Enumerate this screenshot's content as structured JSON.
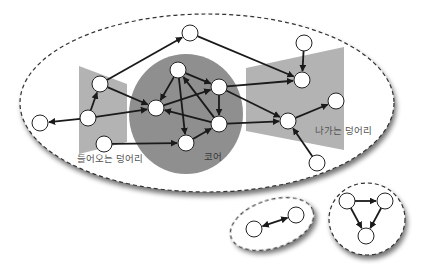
{
  "diagram": {
    "colors": {
      "background": "#ffffff",
      "core_fill": "#8f8f8f",
      "wing_fill": "#b3b3b3",
      "node_fill": "#ffffff",
      "node_stroke": "#222222",
      "edge": "#1a1a1a",
      "boundary": "#333333",
      "label_text": "#555555",
      "core_label_text": "#3a3a3a"
    },
    "labels": {
      "in_component": "들어오는 덩어리",
      "core": "코어",
      "out_component": "나가는 덩어리"
    },
    "regions": [
      {
        "id": "giant",
        "type": "dashed-ellipse",
        "cx": 207,
        "cy": 103,
        "rx": 187,
        "ry": 89
      },
      {
        "id": "in_wing",
        "type": "trapezoid",
        "points": "79,66 127,84 127,142 79,154"
      },
      {
        "id": "core",
        "type": "ellipse",
        "cx": 186,
        "cy": 114,
        "rx": 57,
        "ry": 60
      },
      {
        "id": "out_wing",
        "type": "trapezoid",
        "points": "246,68 344,47 344,150 246,131"
      },
      {
        "id": "small_pair",
        "type": "dashed-ellipse",
        "cx": 272,
        "cy": 224,
        "rx": 43,
        "ry": 24,
        "rotate": -18
      },
      {
        "id": "small_triangle",
        "type": "dashed-ellipse",
        "cx": 367,
        "cy": 219,
        "rx": 38,
        "ry": 36
      }
    ],
    "nodes": [
      {
        "id": "A",
        "x": 190,
        "y": 33
      },
      {
        "id": "B",
        "x": 100,
        "y": 84
      },
      {
        "id": "C",
        "x": 88,
        "y": 118
      },
      {
        "id": "D",
        "x": 40,
        "y": 123
      },
      {
        "id": "E",
        "x": 104,
        "y": 144
      },
      {
        "id": "F",
        "x": 178,
        "y": 70
      },
      {
        "id": "G",
        "x": 156,
        "y": 108
      },
      {
        "id": "H",
        "x": 219,
        "y": 87
      },
      {
        "id": "I",
        "x": 219,
        "y": 124
      },
      {
        "id": "J",
        "x": 186,
        "y": 143
      },
      {
        "id": "K",
        "x": 304,
        "y": 43
      },
      {
        "id": "L",
        "x": 302,
        "y": 80
      },
      {
        "id": "M",
        "x": 336,
        "y": 101
      },
      {
        "id": "N",
        "x": 288,
        "y": 121
      },
      {
        "id": "O",
        "x": 317,
        "y": 163
      },
      {
        "id": "P",
        "x": 254,
        "y": 229
      },
      {
        "id": "Q",
        "x": 296,
        "y": 215
      },
      {
        "id": "R",
        "x": 347,
        "y": 201
      },
      {
        "id": "S",
        "x": 385,
        "y": 201
      },
      {
        "id": "T",
        "x": 366,
        "y": 236
      }
    ],
    "edges": [
      {
        "from": "B",
        "to": "A"
      },
      {
        "from": "A",
        "to": "L"
      },
      {
        "from": "C",
        "to": "D"
      },
      {
        "from": "C",
        "to": "B"
      },
      {
        "from": "B",
        "to": "G"
      },
      {
        "from": "C",
        "to": "G"
      },
      {
        "from": "E",
        "to": "J"
      },
      {
        "from": "F",
        "to": "G"
      },
      {
        "from": "F",
        "to": "H"
      },
      {
        "from": "F",
        "to": "J"
      },
      {
        "from": "G",
        "to": "H"
      },
      {
        "from": "H",
        "to": "I"
      },
      {
        "from": "I",
        "to": "F"
      },
      {
        "from": "I",
        "to": "G"
      },
      {
        "from": "J",
        "to": "I"
      },
      {
        "from": "H",
        "to": "L"
      },
      {
        "from": "H",
        "to": "N"
      },
      {
        "from": "I",
        "to": "N"
      },
      {
        "from": "K",
        "to": "L"
      },
      {
        "from": "N",
        "to": "M"
      },
      {
        "from": "O",
        "to": "N"
      },
      {
        "from": "P",
        "to": "Q",
        "bidirectional": true
      },
      {
        "from": "R",
        "to": "S"
      },
      {
        "from": "R",
        "to": "T"
      },
      {
        "from": "S",
        "to": "T"
      }
    ],
    "node_radius": 8
  }
}
